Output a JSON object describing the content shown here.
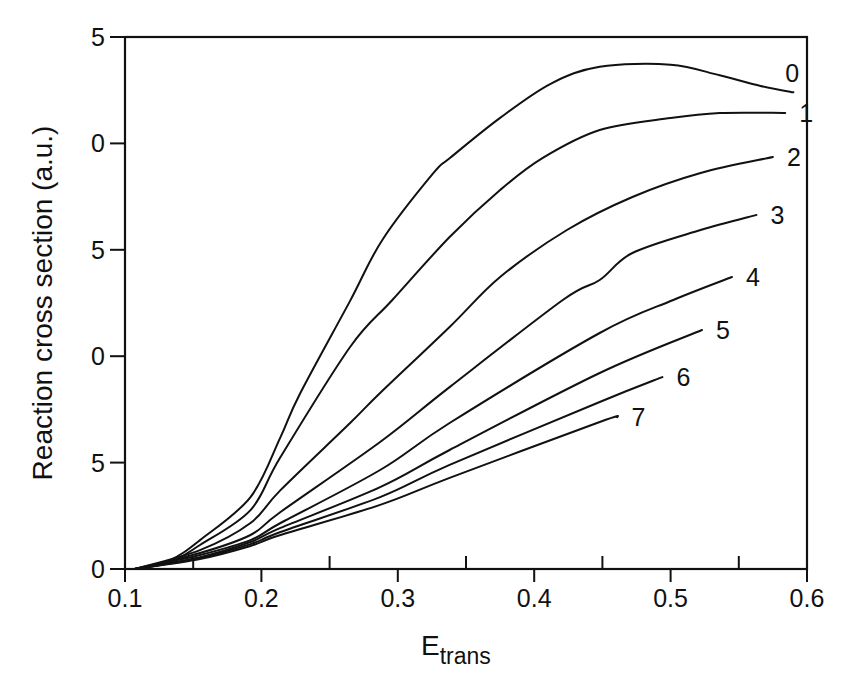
{
  "chart_data": {
    "type": "line",
    "title": "",
    "xlabel": "E",
    "xlabel_subscript": "trans",
    "ylabel": "Reaction cross section (a.u.)",
    "xlim": [
      0.1,
      0.6
    ],
    "ylim": [
      0,
      25
    ],
    "grid": false,
    "legend": "inline labels at curve ends (right)",
    "x_ticks": [
      0.1,
      0.2,
      0.3,
      0.4,
      0.5,
      0.6
    ],
    "x_tick_labels": [
      "0.1",
      "0.2",
      "0.3",
      "0.4",
      "0.5",
      "0.6"
    ],
    "x_minor_ticks": [
      0.15,
      0.25,
      0.35,
      0.45,
      0.55
    ],
    "y_ticks": [
      0,
      5,
      10,
      15,
      20,
      25
    ],
    "y_tick_labels": [
      "0",
      "5",
      "0",
      "5",
      "0",
      "5"
    ],
    "series": [
      {
        "name": "0",
        "x": [
          0.107,
          0.133,
          0.155,
          0.192,
          0.214,
          0.228,
          0.265,
          0.289,
          0.326,
          0.338,
          0.375,
          0.412,
          0.448,
          0.5,
          0.536,
          0.566,
          0.59
        ],
        "y": [
          0,
          0.42,
          1.36,
          3.38,
          6.2,
          8.2,
          12.6,
          15.5,
          18.6,
          19.3,
          21.2,
          22.8,
          23.6,
          23.7,
          23.2,
          22.7,
          22.4
        ]
      },
      {
        "name": "1",
        "x": [
          0.107,
          0.133,
          0.155,
          0.192,
          0.214,
          0.265,
          0.296,
          0.338,
          0.375,
          0.406,
          0.448,
          0.5,
          0.536,
          0.584
        ],
        "y": [
          0,
          0.33,
          1.13,
          2.77,
          5.26,
          10.43,
          12.64,
          15.6,
          17.81,
          19.31,
          20.63,
          21.19,
          21.43,
          21.43
        ]
      },
      {
        "name": "2",
        "x": [
          0.107,
          0.155,
          0.192,
          0.214,
          0.265,
          0.287,
          0.338,
          0.375,
          0.424,
          0.472,
          0.522,
          0.575
        ],
        "y": [
          0,
          0.89,
          2.16,
          3.71,
          6.86,
          8.27,
          11.37,
          13.72,
          15.93,
          17.48,
          18.61,
          19.36
        ]
      },
      {
        "name": "3",
        "x": [
          0.107,
          0.155,
          0.192,
          0.214,
          0.287,
          0.338,
          0.421,
          0.448,
          0.472,
          0.522,
          0.563
        ],
        "y": [
          0,
          0.75,
          1.6,
          2.68,
          5.97,
          8.55,
          12.64,
          13.58,
          14.85,
          15.93,
          16.64
        ]
      },
      {
        "name": "4",
        "x": [
          0.107,
          0.155,
          0.192,
          0.214,
          0.287,
          0.338,
          0.448,
          0.502,
          0.545
        ],
        "y": [
          0,
          0.66,
          1.36,
          2.16,
          4.65,
          6.86,
          11.09,
          12.64,
          13.72
        ]
      },
      {
        "name": "5",
        "x": [
          0.107,
          0.155,
          0.192,
          0.214,
          0.287,
          0.338,
          0.448,
          0.523
        ],
        "y": [
          0,
          0.56,
          1.27,
          1.93,
          3.85,
          5.59,
          9.21,
          11.23
        ]
      },
      {
        "name": "6",
        "x": [
          0.107,
          0.155,
          0.192,
          0.214,
          0.287,
          0.338,
          0.448,
          0.494
        ],
        "y": [
          0,
          0.52,
          1.17,
          1.74,
          3.38,
          4.89,
          7.85,
          9.02
        ]
      },
      {
        "name": "7",
        "x": [
          0.107,
          0.155,
          0.192,
          0.214,
          0.287,
          0.338,
          0.448,
          0.461
        ],
        "y": [
          0,
          0.47,
          1.08,
          1.6,
          3.01,
          4.28,
          6.91,
          7.14
        ]
      }
    ]
  }
}
